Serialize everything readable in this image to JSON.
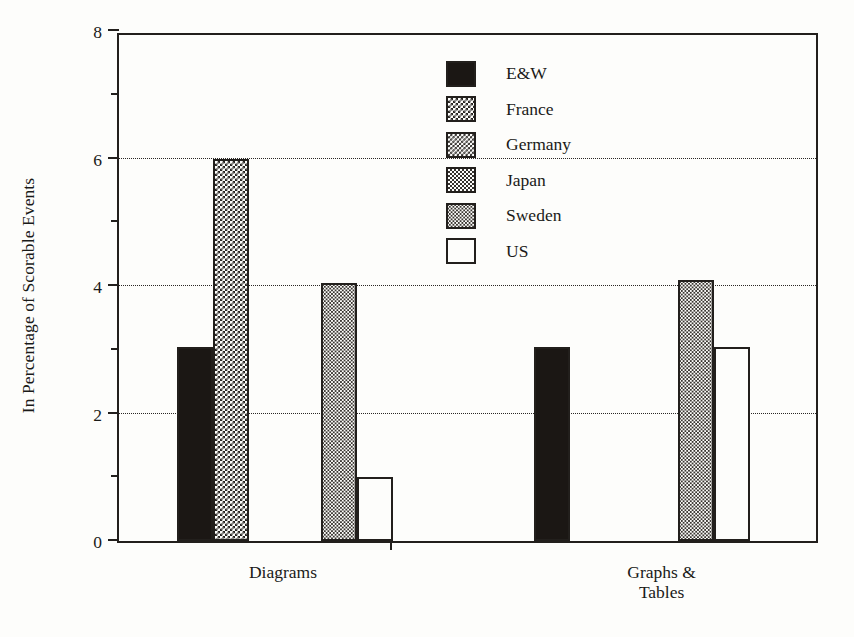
{
  "chart_data": {
    "type": "bar",
    "title": "",
    "subtitle": "",
    "xlabel": "",
    "ylabel": "In Percentage of Scorable Events",
    "categories": [
      "Diagrams",
      "Graphs &\nTables"
    ],
    "category_labels": [
      {
        "line1": "Diagrams",
        "line2": ""
      },
      {
        "line1": "Graphs &",
        "line2": "Tables"
      }
    ],
    "series": [
      {
        "name": "E&W",
        "pattern": "solid",
        "values": [
          3.05,
          3.05
        ]
      },
      {
        "name": "France",
        "pattern": "dark",
        "values": [
          6.0,
          0
        ]
      },
      {
        "name": "Germany",
        "pattern": "mediumdark",
        "values": [
          0,
          0
        ]
      },
      {
        "name": "Japan",
        "pattern": "medium",
        "values": [
          0,
          0
        ]
      },
      {
        "name": "Sweden",
        "pattern": "light",
        "values": [
          4.05,
          4.1
        ]
      },
      {
        "name": "US",
        "pattern": "white",
        "values": [
          1.0,
          3.05
        ]
      }
    ],
    "ylim": [
      0,
      8
    ],
    "yticks": [
      0,
      2,
      4,
      6,
      8
    ],
    "ytick_labels": [
      "0",
      "2",
      "4",
      "6",
      "8"
    ],
    "yminor_ticks": [
      1,
      3,
      5,
      7
    ],
    "gridlines": [
      2,
      4,
      6
    ],
    "grid": "horizontal-dotted",
    "legend_position": "upper-center",
    "legend": [
      {
        "label": "E&W",
        "pattern": "solid"
      },
      {
        "label": "France",
        "pattern": "dark"
      },
      {
        "label": "Germany",
        "pattern": "mediumdark"
      },
      {
        "label": "Japan",
        "pattern": "medium"
      },
      {
        "label": "Sweden",
        "pattern": "light"
      },
      {
        "label": "US",
        "pattern": "white"
      }
    ],
    "colors": {
      "axis": "#221f1c",
      "bar_edge": "#221f1c",
      "bar_solid_fill": "#1b1714",
      "background": "#fdfdfb",
      "grid": "#2a2724"
    }
  }
}
